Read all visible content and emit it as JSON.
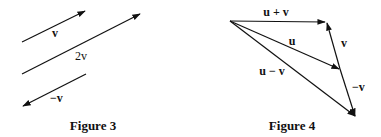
{
  "figure3": {
    "caption": "Figure 3",
    "vectors": [
      {
        "name": "v",
        "label": "v"
      },
      {
        "name": "2v",
        "label": "2v"
      },
      {
        "name": "neg-v",
        "label": "−v"
      }
    ]
  },
  "figure4": {
    "caption": "Figure 4",
    "vectors": [
      {
        "name": "u-plus-v",
        "label": "u + v"
      },
      {
        "name": "u",
        "label": "u"
      },
      {
        "name": "u-minus-v",
        "label": "u − v"
      },
      {
        "name": "v",
        "label": "v"
      },
      {
        "name": "neg-v",
        "label": "−v"
      }
    ]
  },
  "colors": {
    "ink": "#111111",
    "background": "#ffffff"
  }
}
